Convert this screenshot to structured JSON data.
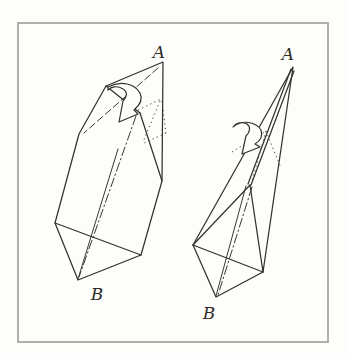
{
  "page": {
    "background_color": "#fdfdfb",
    "frame_color": "#a7a7a3",
    "ink_color": "#35322d"
  },
  "diagram": {
    "type": "origami-instruction-step",
    "figures": [
      {
        "name": "left-shape",
        "top_label": "A",
        "bottom_label": "B",
        "fold_arrow_icon": "curved-fold-arrow"
      },
      {
        "name": "right-shape",
        "top_label": "A",
        "bottom_label": "B",
        "fold_arrow_icon": "curved-fold-arrow"
      }
    ]
  }
}
